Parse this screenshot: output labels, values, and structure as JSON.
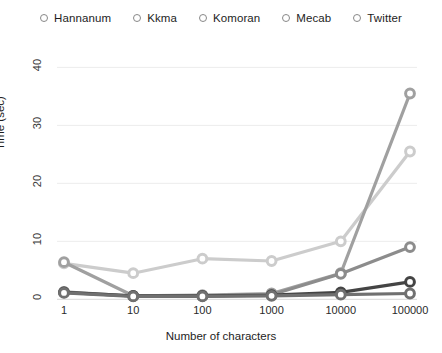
{
  "chart_data": {
    "type": "line",
    "title": "",
    "xlabel": "Number of characters",
    "ylabel": "Time (sec)",
    "x": [
      1,
      10,
      100,
      1000,
      10000,
      100000
    ],
    "xtick_labels": [
      "1",
      "10",
      "100",
      "1000",
      "10000",
      "100000"
    ],
    "ytick_labels": [
      "0",
      "10",
      "20",
      "30",
      "40"
    ],
    "yticks": [
      0,
      10,
      20,
      30,
      40
    ],
    "ylim": [
      -1.5,
      43
    ],
    "xscale": "log",
    "grid": true,
    "legend_position": "top-center",
    "series": [
      {
        "name": "Hannanum",
        "color": "#8c8c8c",
        "values": [
          1.3,
          0.55,
          0.6,
          0.8,
          4.4,
          9.0
        ]
      },
      {
        "name": "Kkma",
        "color": "#a0a0a0",
        "values": [
          6.4,
          0.6,
          0.7,
          1.0,
          4.5,
          35.5
        ]
      },
      {
        "name": "Komoran",
        "color": "#cccccc",
        "values": [
          6.2,
          4.5,
          7.0,
          6.6,
          10.0,
          25.5
        ]
      },
      {
        "name": "Mecab",
        "color": "#707070",
        "values": [
          1.1,
          0.5,
          0.5,
          0.6,
          0.8,
          1.0
        ]
      },
      {
        "name": "Twitter",
        "color": "#444444",
        "values": [
          1.2,
          0.6,
          0.6,
          0.7,
          1.2,
          3.0
        ]
      }
    ]
  }
}
